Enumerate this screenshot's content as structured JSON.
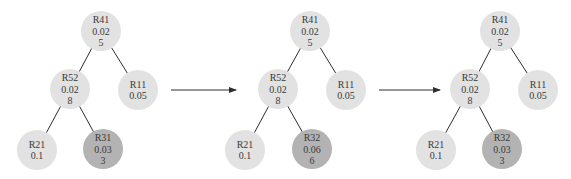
{
  "colors": {
    "node_fill": "#e2e2e2",
    "highlight_fill": "#b3b3b3",
    "edge": "#2e2e2e",
    "arrow": "#2e2e2e",
    "text": "#3a3a3a"
  },
  "node_radius": 20,
  "trees": [
    {
      "nodes": [
        {
          "id": "R41",
          "lines": [
            "R41",
            "0.02",
            "5"
          ],
          "x": 101,
          "y": 31,
          "highlight": false
        },
        {
          "id": "R52",
          "lines": [
            "R52",
            "0.02",
            "8"
          ],
          "x": 70,
          "y": 89,
          "highlight": false
        },
        {
          "id": "R11",
          "lines": [
            "R11",
            "0.05"
          ],
          "x": 138,
          "y": 90,
          "highlight": false
        },
        {
          "id": "R21",
          "lines": [
            "R21",
            "0.1"
          ],
          "x": 37,
          "y": 150,
          "highlight": false
        },
        {
          "id": "R31",
          "lines": [
            "R31",
            "0.03",
            "3"
          ],
          "x": 103,
          "y": 149,
          "highlight": true
        }
      ],
      "edges": [
        [
          "R41",
          "R52"
        ],
        [
          "R41",
          "R11"
        ],
        [
          "R52",
          "R21"
        ],
        [
          "R52",
          "R31"
        ]
      ]
    },
    {
      "nodes": [
        {
          "id": "R41",
          "lines": [
            "R41",
            "0.02",
            "5"
          ],
          "x": 310,
          "y": 31,
          "highlight": false
        },
        {
          "id": "R52",
          "lines": [
            "R52",
            "0.02",
            "8"
          ],
          "x": 278,
          "y": 89,
          "highlight": false
        },
        {
          "id": "R11",
          "lines": [
            "R11",
            "0.05"
          ],
          "x": 346,
          "y": 90,
          "highlight": false
        },
        {
          "id": "R21",
          "lines": [
            "R21",
            "0.1"
          ],
          "x": 245,
          "y": 150,
          "highlight": false
        },
        {
          "id": "R32",
          "lines": [
            "R32",
            "0.06",
            "6"
          ],
          "x": 312,
          "y": 149,
          "highlight": true
        }
      ],
      "edges": [
        [
          "R41",
          "R52"
        ],
        [
          "R41",
          "R11"
        ],
        [
          "R52",
          "R21"
        ],
        [
          "R52",
          "R32"
        ]
      ]
    },
    {
      "nodes": [
        {
          "id": "R41",
          "lines": [
            "R41",
            "0.02",
            "5"
          ],
          "x": 500,
          "y": 31,
          "highlight": false
        },
        {
          "id": "R52",
          "lines": [
            "R52",
            "0.02",
            "8"
          ],
          "x": 470,
          "y": 89,
          "highlight": false
        },
        {
          "id": "R11",
          "lines": [
            "R11",
            "0.05"
          ],
          "x": 538,
          "y": 90,
          "highlight": false
        },
        {
          "id": "R21",
          "lines": [
            "R21",
            "0.1"
          ],
          "x": 436,
          "y": 150,
          "highlight": false
        },
        {
          "id": "R32",
          "lines": [
            "R32",
            "0.03",
            "3"
          ],
          "x": 502,
          "y": 149,
          "highlight": true
        }
      ],
      "edges": [
        [
          "R41",
          "R52"
        ],
        [
          "R41",
          "R11"
        ],
        [
          "R52",
          "R21"
        ],
        [
          "R52",
          "R32"
        ]
      ]
    }
  ],
  "arrows": [
    {
      "x1": 171,
      "y1": 90,
      "x2": 236,
      "y2": 90
    },
    {
      "x1": 379,
      "y1": 90,
      "x2": 440,
      "y2": 90
    }
  ]
}
